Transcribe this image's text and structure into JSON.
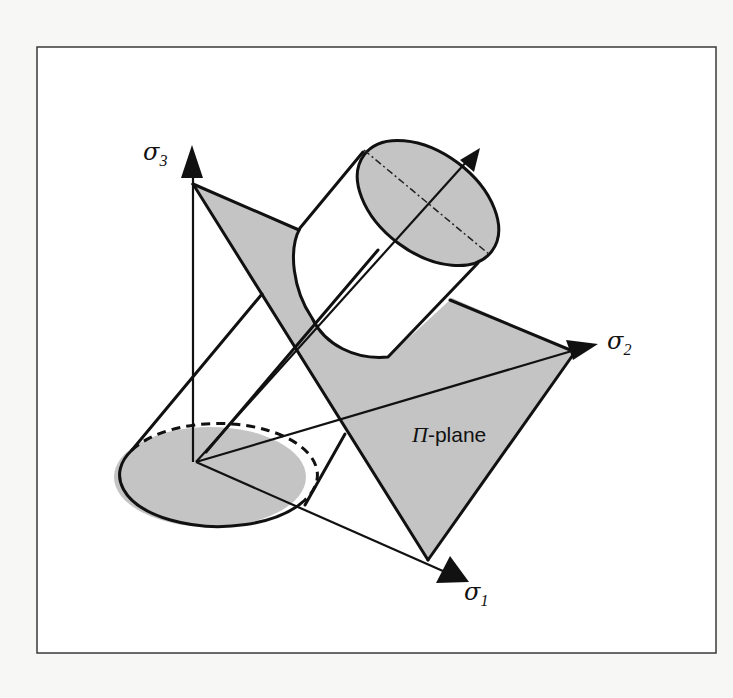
{
  "figure": {
    "axes": [
      {
        "id": "sigma3",
        "symbol": "σ",
        "subscript": "3"
      },
      {
        "id": "sigma2",
        "symbol": "σ",
        "subscript": "2"
      },
      {
        "id": "sigma1",
        "symbol": "σ",
        "subscript": "1"
      }
    ],
    "plane_label": {
      "prefix": "Π",
      "suffix": "-plane"
    },
    "colors": {
      "shade": "#c4c4c4",
      "line": "#111111",
      "background": "#ffffff"
    }
  }
}
